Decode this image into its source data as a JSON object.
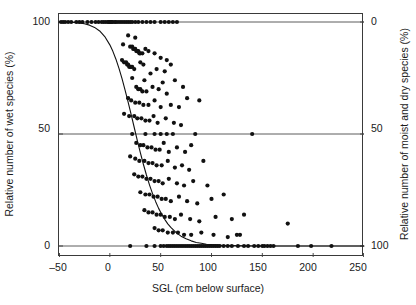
{
  "chart_data": {
    "type": "scatter",
    "title": "",
    "xlabel": "SGL (cm below surface)",
    "ylabel": "Relative number of wet species (%)",
    "ylabel_right": "Relative number of moist and dry species (%)",
    "xlim": [
      -50,
      250
    ],
    "ylim": [
      0,
      100
    ],
    "ylim_right": [
      100,
      0
    ],
    "xticks": [
      -50,
      0,
      50,
      100,
      150,
      200,
      250
    ],
    "xticklabels": [
      "–50",
      "0",
      "50",
      "100",
      "150",
      "200",
      "250"
    ],
    "yticks": [
      0,
      50,
      100
    ],
    "yticklabels": [
      "0",
      "50",
      "100"
    ],
    "yticks_right": [
      0,
      50,
      100
    ],
    "yticklabels_right": [
      "0",
      "50",
      "100"
    ],
    "grid": "horizontal-at-0-50-100",
    "legend": "none",
    "marker": "filled-circle",
    "marker_color": "#111111",
    "marker_size_px": 3.1,
    "curve": {
      "name": "fitted logistic curve",
      "color": "#111111",
      "width_px": 1.1,
      "description": "Sigmoid decreasing from 100% to 0%, inflection near SGL = 23 cm",
      "points": [
        [
          -50,
          100.0
        ],
        [
          -45,
          100.0
        ],
        [
          -40,
          99.9
        ],
        [
          -35,
          99.8
        ],
        [
          -30,
          99.6
        ],
        [
          -25,
          99.2
        ],
        [
          -20,
          98.6
        ],
        [
          -15,
          97.6
        ],
        [
          -10,
          96.0
        ],
        [
          -5,
          93.5
        ],
        [
          0,
          89.8
        ],
        [
          3,
          86.9
        ],
        [
          6,
          83.4
        ],
        [
          9,
          79.3
        ],
        [
          12,
          74.7
        ],
        [
          15,
          69.6
        ],
        [
          18,
          64.2
        ],
        [
          21,
          58.6
        ],
        [
          24,
          52.9
        ],
        [
          27,
          47.2
        ],
        [
          30,
          41.7
        ],
        [
          33,
          36.5
        ],
        [
          36,
          31.7
        ],
        [
          39,
          27.3
        ],
        [
          42,
          23.4
        ],
        [
          45,
          19.9
        ],
        [
          48,
          16.8
        ],
        [
          51,
          14.2
        ],
        [
          54,
          11.9
        ],
        [
          57,
          9.9
        ],
        [
          60,
          8.3
        ],
        [
          65,
          6.1
        ],
        [
          70,
          4.4
        ],
        [
          75,
          3.2
        ],
        [
          80,
          2.3
        ],
        [
          85,
          1.6
        ],
        [
          90,
          1.2
        ],
        [
          95,
          0.8
        ],
        [
          100,
          0.6
        ],
        [
          110,
          0.3
        ],
        [
          120,
          0.15
        ],
        [
          135,
          0.05
        ],
        [
          150,
          0.02
        ],
        [
          175,
          0.0
        ],
        [
          200,
          0.0
        ],
        [
          225,
          0.0
        ],
        [
          250,
          0.0
        ]
      ]
    },
    "points": [
      [
        -48,
        100
      ],
      [
        -46,
        100
      ],
      [
        -44,
        100
      ],
      [
        -41,
        100
      ],
      [
        -38,
        100
      ],
      [
        -33,
        100
      ],
      [
        -30,
        100
      ],
      [
        -27,
        100
      ],
      [
        -22,
        100
      ],
      [
        -18,
        100
      ],
      [
        -14,
        100
      ],
      [
        -11,
        100
      ],
      [
        -8,
        100
      ],
      [
        -6,
        100
      ],
      [
        -4,
        100
      ],
      [
        -2,
        100
      ],
      [
        -1,
        100
      ],
      [
        0,
        100
      ],
      [
        1,
        100
      ],
      [
        2,
        100
      ],
      [
        3,
        100
      ],
      [
        5,
        100
      ],
      [
        6,
        100
      ],
      [
        8,
        100
      ],
      [
        10,
        100
      ],
      [
        12,
        100
      ],
      [
        14,
        100
      ],
      [
        16,
        100
      ],
      [
        18,
        100
      ],
      [
        20,
        100
      ],
      [
        22,
        100
      ],
      [
        25,
        100
      ],
      [
        28,
        100
      ],
      [
        32,
        100
      ],
      [
        36,
        100
      ],
      [
        40,
        100
      ],
      [
        44,
        100
      ],
      [
        50,
        100
      ],
      [
        54,
        100
      ],
      [
        58,
        100
      ],
      [
        62,
        100
      ],
      [
        66,
        100
      ],
      [
        18,
        94
      ],
      [
        25,
        93
      ],
      [
        13,
        90
      ],
      [
        20,
        89
      ],
      [
        22,
        89
      ],
      [
        23,
        88
      ],
      [
        24,
        88
      ],
      [
        25,
        88
      ],
      [
        26,
        87
      ],
      [
        27,
        87
      ],
      [
        28,
        87
      ],
      [
        29,
        86
      ],
      [
        30,
        86
      ],
      [
        32,
        86
      ],
      [
        35,
        88
      ],
      [
        38,
        87
      ],
      [
        44,
        86
      ],
      [
        50,
        84
      ],
      [
        56,
        83
      ],
      [
        60,
        81
      ],
      [
        12,
        83
      ],
      [
        14,
        82
      ],
      [
        16,
        82
      ],
      [
        17,
        81
      ],
      [
        18,
        81
      ],
      [
        19,
        80
      ],
      [
        20,
        80
      ],
      [
        21,
        80
      ],
      [
        22,
        80
      ],
      [
        24,
        79
      ],
      [
        30,
        82
      ],
      [
        33,
        81
      ],
      [
        46,
        79
      ],
      [
        54,
        78
      ],
      [
        22,
        75
      ],
      [
        34,
        74
      ],
      [
        40,
        77
      ],
      [
        52,
        73
      ],
      [
        64,
        74
      ],
      [
        26,
        71
      ],
      [
        28,
        70
      ],
      [
        30,
        70
      ],
      [
        32,
        69
      ],
      [
        36,
        69
      ],
      [
        42,
        71
      ],
      [
        48,
        70
      ],
      [
        56,
        68
      ],
      [
        72,
        71
      ],
      [
        18,
        66
      ],
      [
        21,
        65
      ],
      [
        25,
        64
      ],
      [
        29,
        64
      ],
      [
        33,
        63
      ],
      [
        38,
        63
      ],
      [
        44,
        65
      ],
      [
        50,
        62
      ],
      [
        60,
        63
      ],
      [
        68,
        62
      ],
      [
        76,
        66
      ],
      [
        88,
        65
      ],
      [
        14,
        59
      ],
      [
        19,
        58
      ],
      [
        24,
        58
      ],
      [
        27,
        57
      ],
      [
        31,
        57
      ],
      [
        35,
        56
      ],
      [
        39,
        56
      ],
      [
        43,
        58
      ],
      [
        47,
        55
      ],
      [
        55,
        57
      ],
      [
        63,
        55
      ],
      [
        70,
        54
      ],
      [
        22,
        50
      ],
      [
        35,
        50
      ],
      [
        44,
        50
      ],
      [
        50,
        50
      ],
      [
        56,
        50
      ],
      [
        62,
        50
      ],
      [
        84,
        50
      ],
      [
        140,
        50
      ],
      [
        26,
        46
      ],
      [
        30,
        45
      ],
      [
        33,
        45
      ],
      [
        37,
        44
      ],
      [
        41,
        44
      ],
      [
        45,
        43
      ],
      [
        49,
        43
      ],
      [
        53,
        46
      ],
      [
        58,
        42
      ],
      [
        66,
        44
      ],
      [
        74,
        42
      ],
      [
        80,
        45
      ],
      [
        20,
        40
      ],
      [
        25,
        39
      ],
      [
        29,
        38
      ],
      [
        34,
        38
      ],
      [
        38,
        37
      ],
      [
        42,
        37
      ],
      [
        46,
        36
      ],
      [
        51,
        36
      ],
      [
        57,
        38
      ],
      [
        64,
        35
      ],
      [
        71,
        36
      ],
      [
        78,
        34
      ],
      [
        92,
        38
      ],
      [
        24,
        32
      ],
      [
        28,
        31
      ],
      [
        32,
        31
      ],
      [
        36,
        30
      ],
      [
        40,
        30
      ],
      [
        44,
        29
      ],
      [
        48,
        29
      ],
      [
        52,
        28
      ],
      [
        58,
        30
      ],
      [
        66,
        28
      ],
      [
        73,
        27
      ],
      [
        82,
        29
      ],
      [
        96,
        27
      ],
      [
        30,
        24
      ],
      [
        35,
        23
      ],
      [
        39,
        23
      ],
      [
        43,
        22
      ],
      [
        47,
        22
      ],
      [
        51,
        21
      ],
      [
        55,
        21
      ],
      [
        60,
        20
      ],
      [
        68,
        22
      ],
      [
        76,
        20
      ],
      [
        86,
        19
      ],
      [
        100,
        21
      ],
      [
        112,
        23
      ],
      [
        34,
        16
      ],
      [
        38,
        15
      ],
      [
        42,
        15
      ],
      [
        46,
        14
      ],
      [
        50,
        14
      ],
      [
        54,
        13
      ],
      [
        59,
        13
      ],
      [
        64,
        12
      ],
      [
        70,
        14
      ],
      [
        79,
        12
      ],
      [
        88,
        11
      ],
      [
        104,
        13
      ],
      [
        120,
        12
      ],
      [
        132,
        14
      ],
      [
        44,
        8
      ],
      [
        48,
        7
      ],
      [
        52,
        7
      ],
      [
        57,
        6
      ],
      [
        62,
        6
      ],
      [
        67,
        6
      ],
      [
        73,
        5
      ],
      [
        80,
        5
      ],
      [
        90,
        6
      ],
      [
        102,
        5
      ],
      [
        116,
        4
      ],
      [
        128,
        5
      ],
      [
        175,
        10
      ],
      [
        125,
        5
      ],
      [
        20,
        0
      ],
      [
        36,
        0
      ],
      [
        44,
        0
      ],
      [
        50,
        0
      ],
      [
        53,
        0
      ],
      [
        56,
        0
      ],
      [
        58,
        0
      ],
      [
        60,
        0
      ],
      [
        62,
        0
      ],
      [
        64,
        0
      ],
      [
        66,
        0
      ],
      [
        68,
        0
      ],
      [
        70,
        0
      ],
      [
        72,
        0
      ],
      [
        74,
        0
      ],
      [
        76,
        0
      ],
      [
        78,
        0
      ],
      [
        80,
        0
      ],
      [
        82,
        0
      ],
      [
        84,
        0
      ],
      [
        86,
        0
      ],
      [
        88,
        0
      ],
      [
        90,
        0
      ],
      [
        92,
        0
      ],
      [
        94,
        0
      ],
      [
        96,
        0
      ],
      [
        98,
        0
      ],
      [
        100,
        0
      ],
      [
        102,
        0
      ],
      [
        104,
        0
      ],
      [
        106,
        0
      ],
      [
        108,
        0
      ],
      [
        112,
        0
      ],
      [
        116,
        0
      ],
      [
        120,
        0
      ],
      [
        126,
        0
      ],
      [
        132,
        0
      ],
      [
        136,
        0
      ],
      [
        142,
        0
      ],
      [
        146,
        0
      ],
      [
        150,
        0
      ],
      [
        152,
        0
      ],
      [
        155,
        0
      ],
      [
        158,
        0
      ],
      [
        161,
        0
      ],
      [
        185,
        0
      ],
      [
        198,
        0
      ],
      [
        218,
        0
      ]
    ]
  }
}
